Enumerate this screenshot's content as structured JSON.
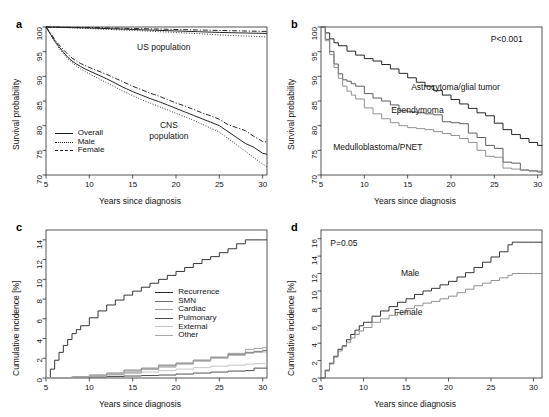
{
  "figure": {
    "panels": [
      "a",
      "b",
      "c",
      "d"
    ],
    "shared_xlabel": "Years since diagnosis"
  },
  "panel_a": {
    "letter": "a",
    "ylabel": "Survival probability",
    "xlabel": "Years since diagnosis",
    "annotations": [
      {
        "text": "US population"
      },
      {
        "text": "CNS"
      },
      {
        "text": "population"
      }
    ],
    "legend": [
      {
        "label": "Overall",
        "style": "solid"
      },
      {
        "label": "Male",
        "style": "dotted"
      },
      {
        "label": "Female",
        "style": "dashdot"
      }
    ]
  },
  "panel_b": {
    "letter": "b",
    "ylabel": "Survival probability",
    "xlabel": "Years since diagnosis",
    "pvalue": "P<0.001",
    "curve_labels": [
      {
        "label": "Astrocytoma/glial tumor"
      },
      {
        "label": "Ependymoma"
      },
      {
        "label": "Medulloblastoma/PNET"
      }
    ]
  },
  "panel_c": {
    "letter": "c",
    "ylabel": "Cumulative incidence [%]",
    "xlabel": "Years since diagnosis",
    "legend": [
      {
        "label": "Recurrence",
        "color": "#2b2b2b"
      },
      {
        "label": "SMN",
        "color": "#6e6e6e"
      },
      {
        "label": "Cardiac",
        "color": "#9a9a9a"
      },
      {
        "label": "Pulmonary",
        "color": "#4a4a4a"
      },
      {
        "label": "External",
        "color": "#c2c2c2"
      },
      {
        "label": "Other",
        "color": "#a8a8a8"
      }
    ]
  },
  "panel_d": {
    "letter": "d",
    "ylabel": "Cumulative incidence [%]",
    "xlabel": "Years since diagnosis",
    "pvalue": "P=0.05",
    "curve_labels": [
      {
        "label": "Male"
      },
      {
        "label": "Female"
      }
    ]
  },
  "chart_data": [
    {
      "panel": "a",
      "type": "line",
      "title": "",
      "xlabel": "Years since diagnosis",
      "ylabel": "Survival probability",
      "xlim": [
        5,
        30.5
      ],
      "ylim": [
        70,
        100
      ],
      "xticks": [
        5,
        10,
        15,
        20,
        25,
        30
      ],
      "yticks": [
        70,
        75,
        80,
        85,
        90,
        95,
        100
      ],
      "grid": false,
      "legend_position": "lower-left",
      "series": [
        {
          "name": "US population",
          "style": "solid",
          "color": "#1a1a1a",
          "x": [
            5,
            7.5,
            10,
            12.5,
            15,
            17.5,
            20,
            22.5,
            25,
            27.5,
            30.5
          ],
          "values": [
            100,
            99.9,
            99.8,
            99.65,
            99.5,
            99.35,
            99.2,
            99.05,
            98.9,
            98.8,
            98.7
          ]
        },
        {
          "name": "US population male",
          "style": "dotted",
          "color": "#1a1a1a",
          "x": [
            5,
            7.5,
            10,
            12.5,
            15,
            17.5,
            20,
            22.5,
            25,
            27.5,
            30.5
          ],
          "values": [
            100,
            99.85,
            99.7,
            99.5,
            99.3,
            99.1,
            98.9,
            98.65,
            98.4,
            98.2,
            98.0
          ]
        },
        {
          "name": "US population female",
          "style": "dashdot",
          "color": "#1a1a1a",
          "x": [
            5,
            7.5,
            10,
            12.5,
            15,
            17.5,
            20,
            22.5,
            25,
            27.5,
            30.5
          ],
          "values": [
            100,
            99.95,
            99.9,
            99.8,
            99.7,
            99.6,
            99.5,
            99.4,
            99.3,
            99.2,
            99.1
          ]
        },
        {
          "name": "Overall",
          "style": "solid",
          "color": "#1a1a1a",
          "x": [
            5,
            5.5,
            6,
            6.5,
            7,
            7.5,
            8,
            8.5,
            9,
            9.5,
            10,
            11,
            12,
            13,
            14,
            15,
            16,
            17,
            18,
            19,
            20,
            21,
            22,
            23,
            24,
            25,
            26,
            27,
            28,
            29,
            30,
            30.5
          ],
          "values": [
            100,
            98.6,
            97.2,
            96.0,
            94.9,
            93.9,
            93.1,
            92.5,
            92.0,
            91.5,
            91.1,
            90.3,
            89.5,
            88.6,
            87.7,
            86.9,
            86.2,
            85.5,
            84.9,
            84.2,
            83.5,
            82.8,
            82.1,
            81.4,
            80.7,
            80.0,
            78.8,
            77.6,
            76.4,
            75.6,
            74.4,
            74.2
          ]
        },
        {
          "name": "Male",
          "style": "dotted",
          "color": "#1a1a1a",
          "x": [
            5,
            5.5,
            6,
            6.5,
            7,
            7.5,
            8,
            8.5,
            9,
            9.5,
            10,
            11,
            12,
            13,
            14,
            15,
            16,
            17,
            18,
            19,
            20,
            21,
            22,
            23,
            24,
            25,
            26,
            27,
            28,
            29,
            30,
            30.5
          ],
          "values": [
            100,
            98.5,
            97.0,
            95.7,
            94.6,
            93.6,
            92.8,
            92.1,
            91.5,
            91.0,
            90.5,
            89.6,
            88.7,
            87.8,
            86.9,
            86.1,
            85.3,
            84.6,
            83.9,
            83.2,
            82.5,
            81.8,
            81.1,
            80.3,
            79.5,
            78.7,
            77.4,
            76.1,
            74.8,
            73.5,
            72.2,
            71.7
          ]
        },
        {
          "name": "Female",
          "style": "dashdot",
          "color": "#1a1a1a",
          "x": [
            5,
            5.5,
            6,
            6.5,
            7,
            7.5,
            8,
            8.5,
            9,
            9.5,
            10,
            11,
            12,
            13,
            14,
            15,
            16,
            17,
            18,
            19,
            20,
            21,
            22,
            23,
            24,
            25,
            26,
            27,
            28,
            29,
            30,
            30.5
          ],
          "values": [
            100,
            98.8,
            97.5,
            96.4,
            95.4,
            94.5,
            93.7,
            93.1,
            92.6,
            92.2,
            91.8,
            91.1,
            90.4,
            89.6,
            88.8,
            88.0,
            87.3,
            86.6,
            86.0,
            85.3,
            84.6,
            84.0,
            83.3,
            82.6,
            82.0,
            81.3,
            80.2,
            79.6,
            79.0,
            77.8,
            76.8,
            76.7
          ]
        }
      ]
    },
    {
      "panel": "b",
      "type": "line",
      "title": "",
      "xlabel": "Years since diagnosis",
      "ylabel": "Survival probability",
      "xlim": [
        5,
        30.5
      ],
      "ylim": [
        70,
        100
      ],
      "xticks": [
        5,
        10,
        15,
        20,
        25,
        30
      ],
      "yticks": [
        70,
        75,
        80,
        85,
        90,
        95,
        100
      ],
      "grid": false,
      "annotation": "P<0.001",
      "series": [
        {
          "name": "Astrocytoma/glial tumor",
          "color": "#1a1a1a",
          "x": [
            5,
            5.5,
            6,
            6.5,
            7,
            8,
            9,
            10,
            11,
            12,
            13,
            14,
            15,
            16,
            17,
            18,
            19,
            20,
            21,
            22,
            23,
            24,
            25,
            26,
            27,
            28,
            29,
            30,
            30.5
          ],
          "values": [
            100,
            98.8,
            97.6,
            96.8,
            96.2,
            95.1,
            94.3,
            93.6,
            93.1,
            92.4,
            91.5,
            90.6,
            89.7,
            88.8,
            88.0,
            87.1,
            86.2,
            85.3,
            84.4,
            83.5,
            82.6,
            82.0,
            80.5,
            79.2,
            78.2,
            77.4,
            76.6,
            76.0,
            75.9
          ]
        },
        {
          "name": "Ependymoma",
          "color": "#555555",
          "x": [
            5,
            5.5,
            6,
            6.5,
            7,
            7.5,
            8,
            8.5,
            9,
            10,
            11,
            12,
            13,
            14,
            15,
            16,
            17,
            18,
            19,
            20,
            21,
            22,
            23,
            24,
            25,
            26,
            27,
            28,
            29,
            30,
            30.5
          ],
          "values": [
            100,
            97.5,
            95.0,
            92.5,
            90.5,
            89.3,
            89.0,
            88.5,
            88.0,
            86.5,
            85.6,
            85.0,
            84.2,
            83.0,
            82.8,
            82.6,
            82.4,
            82.2,
            80.8,
            80.6,
            80.4,
            78.5,
            77.6,
            76.0,
            75.4,
            72.6,
            72.4,
            71.0,
            70.8,
            70.6,
            70.5
          ]
        },
        {
          "name": "Medulloblastoma/PNET",
          "color": "#8c8c8c",
          "x": [
            5,
            5.5,
            6,
            6.5,
            7,
            7.5,
            8,
            8.5,
            9,
            10,
            11,
            12,
            13,
            14,
            15,
            16,
            17,
            18,
            19,
            20,
            21,
            22,
            23,
            24,
            25,
            26,
            27,
            28,
            29,
            30,
            30.5
          ],
          "values": [
            100,
            97.2,
            94.4,
            91.8,
            89.6,
            88.0,
            87.0,
            86.2,
            85.4,
            83.6,
            82.4,
            81.4,
            80.6,
            80.0,
            79.6,
            79.4,
            79.2,
            78.8,
            78.4,
            78.0,
            77.4,
            76.6,
            75.0,
            73.8,
            73.6,
            71.4,
            71.2,
            71.0,
            70.9,
            70.8,
            70.7
          ]
        }
      ]
    },
    {
      "panel": "c",
      "type": "line",
      "title": "",
      "xlabel": "Years since diagnosis",
      "ylabel": "Cumulative incidence [%]",
      "xlim": [
        5,
        30.5
      ],
      "ylim": [
        0,
        15
      ],
      "xticks": [
        5,
        10,
        15,
        20,
        25,
        30
      ],
      "yticks": [
        0,
        2,
        4,
        6,
        8,
        10,
        12,
        14
      ],
      "grid": false,
      "legend_position": "center-right",
      "series": [
        {
          "name": "Recurrence",
          "color": "#2b2b2b",
          "x": [
            5,
            5.5,
            6,
            6.5,
            7,
            7.5,
            8,
            8.5,
            9,
            10,
            11,
            12,
            13,
            14,
            15,
            16,
            17,
            18,
            19,
            20,
            21,
            22,
            23,
            24,
            25,
            26,
            27,
            28,
            29,
            30,
            30.5
          ],
          "values": [
            0,
            0.9,
            1.8,
            2.6,
            3.3,
            3.9,
            4.5,
            4.9,
            5.3,
            6.1,
            6.8,
            7.4,
            7.9,
            8.4,
            8.8,
            9.2,
            9.6,
            10.0,
            10.4,
            10.8,
            11.2,
            11.6,
            12.0,
            12.3,
            12.7,
            13.1,
            13.6,
            14.0,
            14.0,
            14.0,
            14.0
          ]
        },
        {
          "name": "SMN",
          "color": "#6e6e6e",
          "x": [
            5,
            8,
            10,
            12,
            14,
            16,
            18,
            20,
            22,
            24,
            26,
            28,
            29,
            30,
            30.5
          ],
          "values": [
            0,
            0.15,
            0.3,
            0.5,
            0.8,
            1.0,
            1.3,
            1.5,
            1.8,
            2.1,
            2.4,
            2.6,
            2.7,
            2.8,
            2.8
          ]
        },
        {
          "name": "Cardiac",
          "color": "#9a9a9a",
          "x": [
            5,
            8,
            10,
            12,
            14,
            16,
            18,
            20,
            22,
            24,
            26,
            28,
            29,
            30,
            30.5
          ],
          "values": [
            0,
            0.1,
            0.2,
            0.35,
            0.6,
            0.9,
            1.2,
            1.5,
            1.8,
            2.1,
            2.5,
            2.9,
            3.0,
            3.1,
            3.1
          ]
        },
        {
          "name": "Pulmonary",
          "color": "#4a4a4a",
          "x": [
            5,
            8,
            10,
            12,
            14,
            16,
            18,
            20,
            22,
            24,
            26,
            28,
            29,
            30,
            30.5
          ],
          "values": [
            0,
            0.05,
            0.1,
            0.15,
            0.2,
            0.25,
            0.3,
            0.4,
            0.5,
            0.6,
            0.7,
            0.75,
            1.0,
            1.0,
            1.0
          ]
        },
        {
          "name": "External",
          "color": "#c2c2c2",
          "x": [
            5,
            8,
            10,
            12,
            14,
            16,
            18,
            20,
            22,
            24,
            26,
            28,
            29,
            30,
            30.5
          ],
          "values": [
            0,
            0.1,
            0.2,
            0.3,
            0.45,
            0.6,
            0.75,
            0.9,
            1.05,
            1.2,
            1.3,
            1.4,
            1.45,
            1.5,
            1.5
          ]
        },
        {
          "name": "Other",
          "color": "#a8a8a8",
          "x": [
            5,
            8,
            10,
            12,
            14,
            16,
            18,
            20,
            22,
            24,
            26,
            28,
            29,
            30,
            30.5
          ],
          "values": [
            0,
            0.12,
            0.25,
            0.4,
            0.6,
            0.85,
            1.1,
            1.4,
            1.7,
            2.0,
            2.3,
            2.5,
            2.6,
            2.65,
            2.65
          ]
        }
      ]
    },
    {
      "panel": "d",
      "type": "line",
      "title": "",
      "xlabel": "Years since diagnosis",
      "ylabel": "Cumulative incidence [%]",
      "xlim": [
        5,
        31
      ],
      "ylim": [
        0,
        17
      ],
      "xticks": [
        5,
        10,
        15,
        20,
        25,
        30
      ],
      "yticks": [
        0,
        2,
        4,
        6,
        8,
        10,
        12,
        14,
        16
      ],
      "grid": false,
      "annotation": "P=0.05",
      "series": [
        {
          "name": "Male",
          "color": "#2b2b2b",
          "x": [
            5,
            5.5,
            6,
            6.5,
            7,
            7.5,
            8,
            8.5,
            9,
            9.5,
            10,
            11,
            12,
            13,
            14,
            15,
            16,
            17,
            18,
            19,
            20,
            21,
            22,
            23,
            24,
            25,
            26,
            27,
            27.5,
            28,
            29,
            30,
            31
          ],
          "values": [
            0,
            0.9,
            1.7,
            2.5,
            3.3,
            3.7,
            4.4,
            5.0,
            5.5,
            6.0,
            6.4,
            7.1,
            7.7,
            8.2,
            8.7,
            9.1,
            9.6,
            10.0,
            10.3,
            10.7,
            11.1,
            11.6,
            12.1,
            12.7,
            13.3,
            13.9,
            14.5,
            15.3,
            15.6,
            15.6,
            15.6,
            15.6,
            15.6
          ]
        },
        {
          "name": "Female",
          "color": "#8c8c8c",
          "x": [
            5,
            5.5,
            6,
            6.5,
            7,
            7.5,
            8,
            8.5,
            9,
            9.5,
            10,
            11,
            12,
            13,
            14,
            15,
            16,
            17,
            18,
            19,
            20,
            21,
            22,
            23,
            24,
            25,
            26,
            27,
            27.5,
            28,
            29,
            30,
            31
          ],
          "values": [
            0,
            0.8,
            1.6,
            2.4,
            3.1,
            3.6,
            4.1,
            4.6,
            5.0,
            5.4,
            5.8,
            6.4,
            6.8,
            7.2,
            7.5,
            8.0,
            8.3,
            8.6,
            8.8,
            9.1,
            9.4,
            9.8,
            10.2,
            10.6,
            10.9,
            11.2,
            11.5,
            11.8,
            12.0,
            12.0,
            12.0,
            12.0,
            12.0
          ]
        }
      ]
    }
  ]
}
